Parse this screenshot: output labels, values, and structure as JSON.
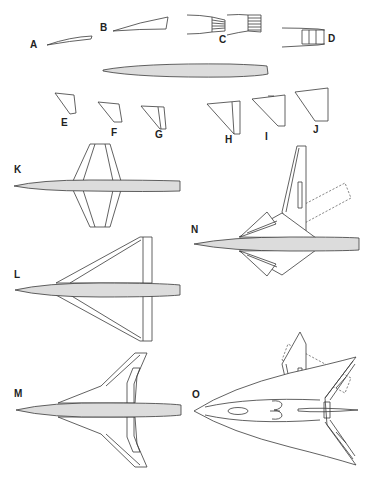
{
  "figure": {
    "colors": {
      "fuselage_fill": "#dcdcdc",
      "line": "#3a3a3a",
      "background": "#ffffff"
    },
    "labels": {
      "A": "A",
      "B": "B",
      "C": "C",
      "D": "D",
      "E": "E",
      "F": "F",
      "G": "G",
      "H": "H",
      "I": "I",
      "J": "J",
      "K": "K",
      "L": "L",
      "M": "M",
      "N": "N",
      "O": "O"
    },
    "parts": [
      {
        "id": "A",
        "kind": "nose-section"
      },
      {
        "id": "B",
        "kind": "nose-section"
      },
      {
        "id": "C",
        "kind": "tail-nozzle"
      },
      {
        "id": "D",
        "kind": "tail-nozzle"
      },
      {
        "id": "E",
        "kind": "wing-panel"
      },
      {
        "id": "F",
        "kind": "wing-panel"
      },
      {
        "id": "G",
        "kind": "wing-panel"
      },
      {
        "id": "H",
        "kind": "wing-panel"
      },
      {
        "id": "I",
        "kind": "wing-panel"
      },
      {
        "id": "J",
        "kind": "wing-panel"
      },
      {
        "id": "K",
        "kind": "planform-straight-wing"
      },
      {
        "id": "L",
        "kind": "planform-delta-wing"
      },
      {
        "id": "M",
        "kind": "planform-cranked-wing"
      },
      {
        "id": "N",
        "kind": "planform-variable-sweep"
      },
      {
        "id": "O",
        "kind": "planform-blended-body"
      }
    ]
  }
}
